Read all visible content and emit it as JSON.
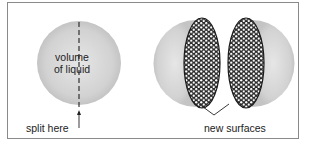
{
  "diagram": {
    "left_sphere": {
      "label_line1": "volume",
      "label_line2": "of liquid",
      "split_label": "split here"
    },
    "right_halves": {
      "label": "new surfaces"
    },
    "colors": {
      "sphere_fill": "#d4d4d4",
      "sphere_edge": "#bdbdbd",
      "surface_dark": "#2a2a2a",
      "border": "#8a8a8a"
    }
  }
}
